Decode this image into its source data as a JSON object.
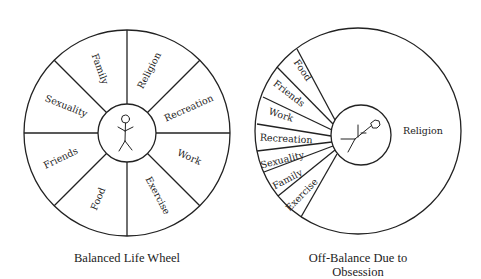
{
  "diagrams": [
    {
      "id": "balanced",
      "title": "Balanced Life Wheel",
      "center_figure": "stick-figure-upright",
      "segments": [
        "Family",
        "Religion",
        "Recreation",
        "Work",
        "Exercise",
        "Food",
        "Friends",
        "Sexuality"
      ]
    },
    {
      "id": "off-balance",
      "title_line1": "Off-Balance Due to",
      "title_line2": "Obsession",
      "center_figure": "stick-figure-tilted",
      "dominant_segment": "Religion",
      "small_segments": [
        "Food",
        "Friends",
        "Work",
        "Recreation",
        "Sexuality",
        "Family",
        "Exercise"
      ]
    }
  ]
}
